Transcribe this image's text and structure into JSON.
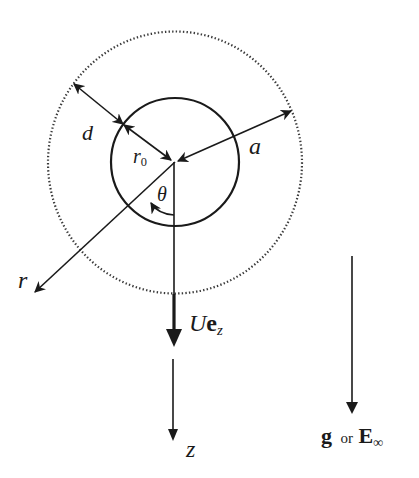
{
  "diagram": {
    "colors": {
      "ink": "#1a1a1a",
      "dotted": "#3a3a3a",
      "background": "#ffffff"
    },
    "shapes": {
      "inner_sphere": {
        "label": "drop",
        "cx": 175,
        "cy": 162,
        "r": 64
      },
      "outer_sphere": {
        "label": "outer boundary (dotted)",
        "cx": 175,
        "cy": 162.5,
        "rx": 127,
        "ry": 131
      }
    },
    "labels": {
      "d": "d",
      "r0_main": "r",
      "r0_sub": "0",
      "a": "a",
      "theta": "θ",
      "r": "r",
      "velocity_U": "U",
      "velocity_e": "e",
      "velocity_sub": "z",
      "z": "z",
      "field_g": "g",
      "field_or": "or",
      "field_E": "E",
      "field_sub": "∞"
    },
    "arrows": [
      {
        "name": "d-dimension",
        "from": [
          74,
          84
        ],
        "to": [
          123,
          124
        ],
        "double": true
      },
      {
        "name": "r0-radius",
        "from": [
          123,
          124
        ],
        "to": [
          172,
          160
        ],
        "double": true
      },
      {
        "name": "a-radius",
        "from": [
          176,
          161
        ],
        "to": [
          291,
          111
        ],
        "double": true
      },
      {
        "name": "r-axis",
        "from": [
          175,
          162
        ],
        "to": [
          34,
          293
        ]
      },
      {
        "name": "velocity-Uez",
        "from": [
          173,
          162
        ],
        "to": [
          173,
          346
        ],
        "thick": true
      },
      {
        "name": "z-axis",
        "from": [
          173,
          359
        ],
        "to": [
          173,
          440
        ]
      },
      {
        "name": "gravity-field",
        "from": [
          352,
          256
        ],
        "to": [
          352,
          413
        ]
      }
    ]
  }
}
